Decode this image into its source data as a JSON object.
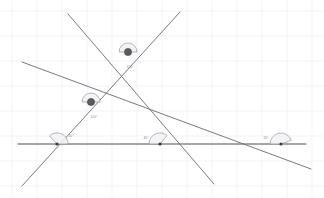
{
  "figure": {
    "background_color": "#ffffff",
    "line_color": "#6b6b70",
    "accent_color": "#5a5a60",
    "arc_fill_color": "#f2f2f4",
    "arc_stroke_color": "#9a9aa0",
    "grid_color": "#eef0f4",
    "label_color": "#8c8c93",
    "width": 324,
    "height": 198
  },
  "grid": {
    "visible": true,
    "spacing": 25,
    "x_positions": [
      12,
      37,
      62,
      87,
      112,
      137,
      162,
      187,
      212,
      237,
      262,
      287,
      312
    ],
    "y_positions": [
      11,
      36,
      61,
      86,
      111,
      136,
      161,
      186
    ]
  },
  "lines": [
    {
      "name": "horizontal-line",
      "x1": 18,
      "y1": 144,
      "x2": 306,
      "y2": 144,
      "weight": "dark"
    },
    {
      "name": "transversal-line",
      "x1": 22,
      "y1": 186,
      "x2": 180,
      "y2": 12,
      "weight": "normal"
    },
    {
      "name": "parallel-line-upper",
      "x1": 22,
      "y1": 62,
      "x2": 311,
      "y2": 169,
      "weight": "normal"
    },
    {
      "name": "parallel-line-lower",
      "x1": 68,
      "y1": 14,
      "x2": 214,
      "y2": 184,
      "weight": "normal"
    }
  ],
  "vertices": [
    {
      "name": "upper-intersection",
      "x": 128,
      "y": 52,
      "r": 3.6,
      "style": "large"
    },
    {
      "name": "lower-intersection",
      "x": 91,
      "y": 102,
      "r": 3.6,
      "style": "large"
    },
    {
      "name": "left-base-vertex",
      "x": 57,
      "y": 144,
      "r": 1.6,
      "style": "small"
    },
    {
      "name": "mid-base-vertex",
      "x": 160,
      "y": 144,
      "r": 1.6,
      "style": "small"
    },
    {
      "name": "right-base-vertex",
      "x": 281,
      "y": 144,
      "r": 1.6,
      "style": "small"
    }
  ],
  "angles": [
    {
      "name": "angle-upper-intersection",
      "label": "120°",
      "vertex_x": 128,
      "vertex_y": 52,
      "radius": 9,
      "start_deg": 180,
      "end_deg": 360,
      "label_x": 130,
      "label_y": 67
    },
    {
      "name": "angle-lower-intersection",
      "label": "120°",
      "vertex_x": 91,
      "vertex_y": 102,
      "radius": 9,
      "start_deg": 180,
      "end_deg": 360,
      "label_x": 94,
      "label_y": 117
    },
    {
      "name": "angle-left-base",
      "label": "50°",
      "vertex_x": 57,
      "vertex_y": 144,
      "radius": 11,
      "start_deg": 227,
      "end_deg": 360,
      "label_x": 71,
      "label_y": 136
    },
    {
      "name": "angle-mid-base",
      "label": "40°",
      "vertex_x": 160,
      "vertex_y": 144,
      "radius": 11,
      "start_deg": 180,
      "end_deg": 310,
      "label_x": 146,
      "label_y": 138
    },
    {
      "name": "angle-right-base",
      "label": "20°",
      "vertex_x": 281,
      "vertex_y": 144,
      "radius": 11,
      "start_deg": 180,
      "end_deg": 340,
      "label_x": 266,
      "label_y": 138
    }
  ]
}
